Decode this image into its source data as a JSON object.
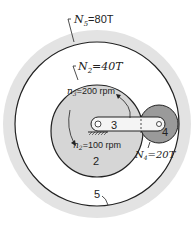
{
  "diagram": {
    "type": "planetary-gear-train",
    "colors": {
      "ring_fill": "#e3e3e3",
      "gear2_fill": "#d6d6d6",
      "gear4_fill": "#9a9a9a",
      "arm_fill": "#f4f4f4",
      "line": "#222222"
    },
    "labels": {
      "n5": {
        "sym": "N",
        "sub": "5",
        "val": "=80T"
      },
      "n2": {
        "sym": "N",
        "sub": "2",
        "val": "=40T"
      },
      "n4": {
        "sym": "N",
        "sub": "4",
        "val": "=20T"
      },
      "speed3": {
        "sym": "n",
        "sub": "3",
        "val": "=200 rpm"
      },
      "speed2": {
        "sym": "n",
        "sub": "2",
        "val": "=100 rpm"
      }
    },
    "members": {
      "gear2": "2",
      "arm3": "3",
      "gear4": "4",
      "ring5": "5"
    }
  }
}
